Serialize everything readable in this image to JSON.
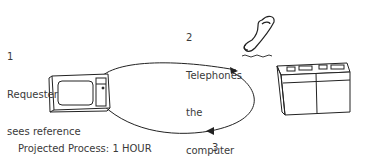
{
  "diagram": {
    "steps": [
      {
        "number": "1",
        "lines": [
          "Requester",
          "sees reference",
          "on TV",
          "screen"
        ]
      },
      {
        "number": "2",
        "lines": [
          "Telephones",
          "the",
          "computer"
        ]
      },
      {
        "number": "3",
        "lines": [
          "Computer",
          "displays article on screen"
        ]
      }
    ],
    "footer": "Projected Process: 1 HOUR",
    "icons": [
      "tv-icon",
      "telephone-icon",
      "computer-icon"
    ]
  }
}
